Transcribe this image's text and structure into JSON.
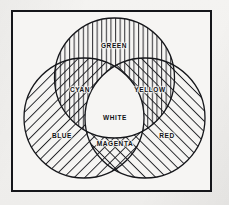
{
  "figure": {
    "background_color": "#f2f1ef",
    "paper_color": "#f6f5f3",
    "ink_color": "#15161a",
    "frame": {
      "name": "border-frame",
      "x": 11,
      "y": 10,
      "width": 201,
      "height": 182,
      "stroke_width": 2
    }
  },
  "circles": [
    {
      "id": "green",
      "label": "GREEN",
      "cx": 114.5,
      "cy": 78,
      "r": 60,
      "hatch": "vertical",
      "label_x": 114,
      "label_y": 45
    },
    {
      "id": "blue",
      "label": "BLUE",
      "cx": 84,
      "cy": 118,
      "r": 60,
      "hatch": "diagonal-up",
      "label_x": 62,
      "label_y": 135
    },
    {
      "id": "red",
      "label": "RED",
      "cx": 145,
      "cy": 118,
      "r": 60,
      "hatch": "diagonal-down",
      "label_x": 167,
      "label_y": 135
    }
  ],
  "intersections": [
    {
      "id": "cyan",
      "label": "CYAN",
      "components": [
        "green",
        "blue"
      ],
      "hatch": "vertical + diagonal-up",
      "label_x": 80,
      "label_y": 89
    },
    {
      "id": "yellow",
      "label": "YELLOW",
      "components": [
        "green",
        "red"
      ],
      "hatch": "vertical + diagonal-down",
      "label_x": 150,
      "label_y": 89
    },
    {
      "id": "magenta",
      "label": "MAGENTA",
      "components": [
        "blue",
        "red"
      ],
      "hatch": "diagonal-up + diagonal-down",
      "label_x": 115,
      "label_y": 143
    },
    {
      "id": "white",
      "label": "WHITE",
      "components": [
        "green",
        "blue",
        "red"
      ],
      "hatch": "none",
      "label_x": 115,
      "label_y": 117
    }
  ]
}
